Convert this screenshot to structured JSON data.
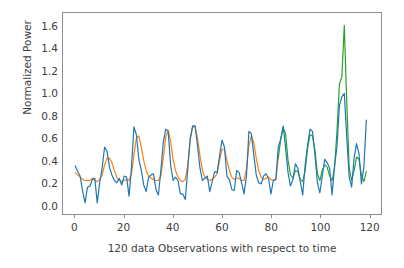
{
  "chart_data": {
    "type": "line",
    "title": "",
    "xlabel": "120 data Observations with respect to time",
    "ylabel": "Normalized Power",
    "xlim": [
      -5,
      125
    ],
    "ylim": [
      -0.08,
      1.72
    ],
    "xticks": [
      0,
      20,
      40,
      60,
      80,
      100,
      120
    ],
    "yticks": [
      0.0,
      0.2,
      0.4,
      0.6,
      0.8,
      1.0,
      1.2,
      1.4,
      1.6
    ],
    "ytick_labels": [
      "0.0",
      "0.2",
      "0.4",
      "0.6",
      "0.8",
      "1.0",
      "1.2",
      "1.4",
      "1.6"
    ],
    "xtick_labels": [
      "0",
      "20",
      "40",
      "60",
      "80",
      "100",
      "120"
    ],
    "grid": false,
    "legend": "none",
    "colors": {
      "observed": "#1f77b4",
      "fitted_train": "#ff7f0e",
      "fitted_test": "#2ca02c",
      "axis": "#8d8d8d",
      "text": "#3d3d3d",
      "background": "#ffffff"
    },
    "series": [
      {
        "name": "observed",
        "color": "#1f77b4",
        "x": [
          0,
          1,
          2,
          3,
          4,
          5,
          6,
          7,
          8,
          9,
          10,
          11,
          12,
          13,
          14,
          15,
          16,
          17,
          18,
          19,
          20,
          21,
          22,
          23,
          24,
          25,
          26,
          27,
          28,
          29,
          30,
          31,
          32,
          33,
          34,
          35,
          36,
          37,
          38,
          39,
          40,
          41,
          42,
          43,
          44,
          45,
          46,
          47,
          48,
          49,
          50,
          51,
          52,
          53,
          54,
          55,
          56,
          57,
          58,
          59,
          60,
          61,
          62,
          63,
          64,
          65,
          66,
          67,
          68,
          69,
          70,
          71,
          72,
          73,
          74,
          75,
          76,
          77,
          78,
          79,
          80,
          81,
          82,
          83,
          84,
          85,
          86,
          87,
          88,
          89,
          90,
          91,
          92,
          93,
          94,
          95,
          96,
          97,
          98,
          99,
          100,
          101,
          102,
          103,
          104,
          105,
          106,
          107,
          108,
          109,
          110,
          111,
          112,
          113,
          114,
          115,
          116,
          117,
          118,
          119
        ],
        "values": [
          0.35,
          0.3,
          0.26,
          0.13,
          0.02,
          0.16,
          0.17,
          0.23,
          0.24,
          0.02,
          0.2,
          0.33,
          0.52,
          0.48,
          0.34,
          0.27,
          0.22,
          0.2,
          0.24,
          0.18,
          0.26,
          0.25,
          0.08,
          0.34,
          0.7,
          0.63,
          0.41,
          0.31,
          0.18,
          0.12,
          0.25,
          0.27,
          0.28,
          0.14,
          0.09,
          0.31,
          0.56,
          0.68,
          0.66,
          0.36,
          0.22,
          0.25,
          0.22,
          0.1,
          0.1,
          0.05,
          0.32,
          0.6,
          0.71,
          0.71,
          0.53,
          0.33,
          0.22,
          0.24,
          0.26,
          0.12,
          0.21,
          0.3,
          0.29,
          0.44,
          0.58,
          0.52,
          0.26,
          0.23,
          0.14,
          0.13,
          0.31,
          0.29,
          0.2,
          0.1,
          0.26,
          0.66,
          0.64,
          0.45,
          0.27,
          0.2,
          0.19,
          0.26,
          0.28,
          0.24,
          0.1,
          0.22,
          0.23,
          0.52,
          0.59,
          0.71,
          0.51,
          0.29,
          0.17,
          0.23,
          0.37,
          0.33,
          0.21,
          0.09,
          0.36,
          0.54,
          0.68,
          0.66,
          0.45,
          0.2,
          0.11,
          0.26,
          0.41,
          0.38,
          0.33,
          0.09,
          0.35,
          0.52,
          0.89,
          0.97,
          1.0,
          0.61,
          0.25,
          0.16,
          0.42,
          0.55,
          0.46,
          0.19,
          0.34,
          0.76
        ]
      },
      {
        "name": "fitted_train",
        "color": "#ff7f0e",
        "x": [
          0,
          1,
          2,
          3,
          4,
          5,
          6,
          7,
          8,
          9,
          10,
          11,
          12,
          13,
          14,
          15,
          16,
          17,
          18,
          19,
          20,
          21,
          22,
          23,
          24,
          25,
          26,
          27,
          28,
          29,
          30,
          31,
          32,
          33,
          34,
          35,
          36,
          37,
          38,
          39,
          40,
          41,
          42,
          43,
          44,
          45,
          46,
          47,
          48,
          49,
          50,
          51,
          52,
          53,
          54,
          55,
          56,
          57,
          58,
          59,
          60,
          61,
          62,
          63,
          64,
          65,
          66,
          67,
          68,
          69,
          70,
          71,
          72,
          73,
          74,
          75,
          76,
          77,
          78,
          79,
          80,
          81,
          82,
          83
        ],
        "values": [
          0.29,
          0.27,
          0.25,
          0.23,
          0.22,
          0.22,
          0.22,
          0.24,
          0.22,
          0.21,
          0.23,
          0.27,
          0.36,
          0.42,
          0.42,
          0.38,
          0.31,
          0.25,
          0.22,
          0.21,
          0.22,
          0.23,
          0.22,
          0.28,
          0.45,
          0.6,
          0.62,
          0.52,
          0.4,
          0.31,
          0.26,
          0.24,
          0.23,
          0.22,
          0.22,
          0.26,
          0.42,
          0.61,
          0.67,
          0.57,
          0.41,
          0.31,
          0.25,
          0.22,
          0.21,
          0.23,
          0.36,
          0.58,
          0.7,
          0.7,
          0.6,
          0.44,
          0.31,
          0.25,
          0.23,
          0.22,
          0.23,
          0.25,
          0.28,
          0.4,
          0.5,
          0.5,
          0.4,
          0.31,
          0.25,
          0.23,
          0.24,
          0.24,
          0.22,
          0.22,
          0.32,
          0.53,
          0.62,
          0.56,
          0.42,
          0.31,
          0.25,
          0.23,
          0.24,
          0.25,
          0.23,
          0.22,
          0.23,
          0.42
        ]
      },
      {
        "name": "fitted_test",
        "color": "#2ca02c",
        "x": [
          83,
          84,
          85,
          86,
          87,
          88,
          89,
          90,
          91,
          92,
          93,
          94,
          95,
          96,
          97,
          98,
          99,
          100,
          101,
          102,
          103,
          104,
          105,
          106,
          107,
          108,
          109,
          110,
          111,
          112,
          113,
          114,
          115,
          116,
          117,
          118,
          119
        ],
        "values": [
          0.42,
          0.59,
          0.69,
          0.64,
          0.4,
          0.27,
          0.24,
          0.31,
          0.3,
          0.23,
          0.21,
          0.31,
          0.51,
          0.63,
          0.62,
          0.49,
          0.28,
          0.22,
          0.31,
          0.36,
          0.34,
          0.26,
          0.22,
          0.33,
          0.66,
          1.08,
          1.15,
          1.61,
          0.92,
          0.33,
          0.22,
          0.31,
          0.43,
          0.41,
          0.27,
          0.21,
          0.3
        ]
      }
    ]
  }
}
